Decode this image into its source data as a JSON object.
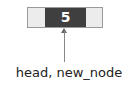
{
  "diagram": {
    "type": "linked-list-node",
    "node": {
      "value": "5"
    },
    "pointer_label": "head, new_node"
  }
}
